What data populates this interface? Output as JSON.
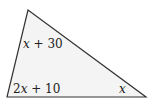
{
  "diagram": {
    "type": "triangle",
    "fill_color": "#f4f4f4",
    "stroke_color": "#333333",
    "vertices": {
      "top": [
        28,
        10
      ],
      "bottom_left": [
        7,
        97
      ],
      "bottom_right": [
        146,
        97
      ]
    },
    "angle_labels": {
      "top": {
        "var": "x",
        "rest": " + 30"
      },
      "bottom_left": {
        "coef": "2",
        "var": "x",
        "rest": " + 10"
      },
      "bottom_right": {
        "var": "x"
      }
    }
  }
}
